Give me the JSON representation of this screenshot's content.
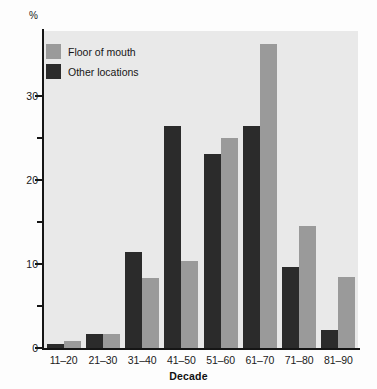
{
  "chart_data": {
    "type": "bar",
    "title": "",
    "xlabel": "Decade",
    "ylabel": "%",
    "ylim": [
      0,
      38
    ],
    "yticks": [
      0,
      10,
      20,
      30
    ],
    "yminorticks": [
      5,
      15,
      25
    ],
    "grid": false,
    "legend_position": "top-left",
    "categories": [
      "11–20",
      "21–30",
      "31–40",
      "41–50",
      "51–60",
      "61–70",
      "71–80",
      "81–90"
    ],
    "series": [
      {
        "name": "Other locations",
        "color": "#2b2b2b",
        "values": [
          0.5,
          1.7,
          11.4,
          26.4,
          23.1,
          26.4,
          9.6,
          2.1
        ]
      },
      {
        "name": "Floor of mouth",
        "color": "#9a9a9a",
        "values": [
          0.8,
          1.7,
          8.3,
          10.4,
          25.0,
          36.2,
          14.5,
          8.4
        ]
      }
    ]
  },
  "legend": {
    "entries": [
      {
        "label": "Floor of mouth",
        "color": "#9a9a9a"
      },
      {
        "label": "Other locations",
        "color": "#2b2b2b"
      }
    ]
  },
  "axes": {
    "y_unit_label": "%",
    "x_title": "Decade",
    "y_tick_labels": [
      "0",
      "10",
      "20",
      "30"
    ]
  },
  "colors": {
    "plot_background": "#e9e9e9",
    "page_background": "#fdfdfd",
    "axis": "#151515",
    "series_dark": "#2b2b2b",
    "series_light": "#9a9a9a"
  }
}
